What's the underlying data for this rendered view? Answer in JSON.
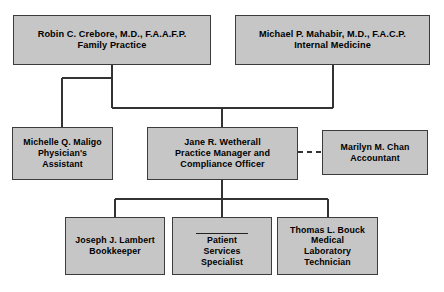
{
  "chart": {
    "type": "org-chart",
    "box_fill_color": "#c6c6c6",
    "box_border_color": "#3c3c3c",
    "connector_color": "#333333",
    "background_color": "#ffffff",
    "nodes": [
      {
        "id": "crebore",
        "level": 1,
        "name": "Robin C. Crebore, M.D., F.A.A.F.P.",
        "role": "Family Practice"
      },
      {
        "id": "mahabir",
        "level": 1,
        "name": "Michael P. Mahabir, M.D., F.A.C.P.",
        "role": "Internal Medicine"
      },
      {
        "id": "maligo",
        "level": 2,
        "name": "Michelle Q. Maligo",
        "role_line1": "Physician's",
        "role_line2": "Assistant"
      },
      {
        "id": "wetherall",
        "level": 2,
        "name": "Jane R. Wetherall",
        "role_line1": "Practice Manager and",
        "role_line2": "Compliance Officer"
      },
      {
        "id": "chan",
        "level": 2,
        "name": "Marilyn M. Chan",
        "role": "Accountant"
      },
      {
        "id": "lambert",
        "level": 3,
        "name": "Joseph J. Lambert",
        "role": "Bookkeeper"
      },
      {
        "id": "patient-services",
        "level": 3,
        "name": "",
        "name_is_blank": true,
        "role_line1": "Patient",
        "role_line2": "Services",
        "role_line3": "Specialist"
      },
      {
        "id": "bouck",
        "level": 3,
        "name": "Thomas L. Bouck",
        "role_line1": "Medical",
        "role_line2": "Laboratory",
        "role_line3": "Technician"
      }
    ],
    "connections": [
      {
        "from": "crebore",
        "to": "maligo",
        "style": "solid"
      },
      {
        "from": "crebore",
        "to": "wetherall",
        "style": "solid"
      },
      {
        "from": "mahabir",
        "to": "wetherall",
        "style": "solid"
      },
      {
        "from": "wetherall",
        "to": "chan",
        "style": "dashed"
      },
      {
        "from": "wetherall",
        "to": "lambert",
        "style": "solid"
      },
      {
        "from": "wetherall",
        "to": "patient-services",
        "style": "solid"
      },
      {
        "from": "wetherall",
        "to": "bouck",
        "style": "solid"
      }
    ]
  }
}
